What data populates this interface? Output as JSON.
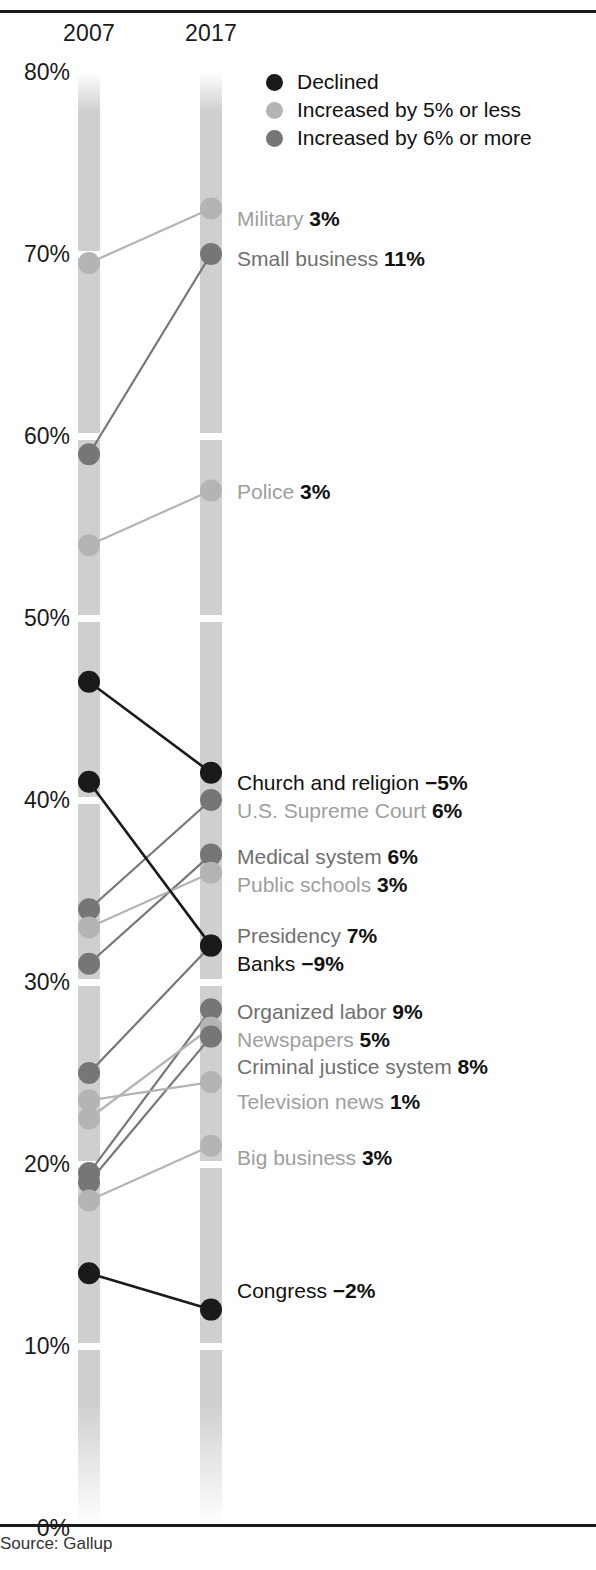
{
  "header": {
    "columns": [
      "2007",
      "2017"
    ]
  },
  "source": {
    "text": "Source: Gallup"
  },
  "legend": {
    "position": "top-right",
    "items": [
      {
        "label": "Declined",
        "color": "#1a1a1a"
      },
      {
        "label": "Increased by 5% or less",
        "color": "#b4b4b4"
      },
      {
        "label": "Increased by 6% or more",
        "color": "#767676"
      }
    ]
  },
  "axis": {
    "ticks": [
      "80%",
      "70%",
      "60%",
      "50%",
      "40%",
      "30%",
      "20%",
      "10%",
      "0%"
    ],
    "min": 0,
    "max": 80
  },
  "colors": {
    "declined": "#1a1a1a",
    "increase_small": "#b4b4b4",
    "increase_large": "#767676",
    "bar": "#cfcfcf",
    "rule": "#1a1a1a",
    "label_dark": "#111111",
    "label_mid": "#6f6f6f",
    "label_light": "#9e9e9e"
  },
  "chart_data": {
    "type": "line",
    "subtype": "slope-chart",
    "title": "",
    "xlabel": "",
    "ylabel": "",
    "categories": [
      "2007",
      "2017"
    ],
    "ylim": [
      0,
      80
    ],
    "ytick_labels": [
      "0%",
      "10%",
      "20%",
      "30%",
      "40%",
      "50%",
      "60%",
      "70%",
      "80%"
    ],
    "grid": false,
    "series": [
      {
        "name": "Military",
        "label": "Military",
        "value_label": "3%",
        "delta": 3,
        "v2007": 69.5,
        "v2017": 72.5,
        "group": "increase_small"
      },
      {
        "name": "Small business",
        "label": "Small business",
        "value_label": "11%",
        "delta": 11,
        "v2007": 59.0,
        "v2017": 70.0,
        "group": "increase_large"
      },
      {
        "name": "Police",
        "label": "Police",
        "value_label": "3%",
        "delta": 3,
        "v2007": 54.0,
        "v2017": 57.0,
        "group": "increase_small"
      },
      {
        "name": "Church and religion",
        "label": "Church and religion",
        "value_label": "−5%",
        "delta": -5,
        "v2007": 46.5,
        "v2017": 41.5,
        "group": "declined"
      },
      {
        "name": "U.S. Supreme Court",
        "label": "U.S. Supreme Court",
        "value_label": "6%",
        "delta": 6,
        "v2007": 34.0,
        "v2017": 40.0,
        "group": "increase_large"
      },
      {
        "name": "Medical system",
        "label": "Medical system",
        "value_label": "6%",
        "delta": 6,
        "v2007": 31.0,
        "v2017": 37.0,
        "group": "increase_large"
      },
      {
        "name": "Public schools",
        "label": "Public schools",
        "value_label": "3%",
        "delta": 3,
        "v2007": 33.0,
        "v2017": 36.0,
        "group": "increase_small"
      },
      {
        "name": "Presidency",
        "label": "Presidency",
        "value_label": "7%",
        "delta": 7,
        "v2007": 25.0,
        "v2017": 32.0,
        "group": "increase_large"
      },
      {
        "name": "Banks",
        "label": "Banks",
        "value_label": "−9%",
        "delta": -9,
        "v2007": 41.0,
        "v2017": 32.0,
        "group": "declined"
      },
      {
        "name": "Organized labor",
        "label": "Organized labor",
        "value_label": "9%",
        "delta": 9,
        "v2007": 19.5,
        "v2017": 28.5,
        "group": "increase_large"
      },
      {
        "name": "Newspapers",
        "label": "Newspapers",
        "value_label": "5%",
        "delta": 5,
        "v2007": 22.5,
        "v2017": 27.5,
        "group": "increase_small"
      },
      {
        "name": "Criminal justice system",
        "label": "Criminal justice system",
        "value_label": "8%",
        "delta": 8,
        "v2007": 19.0,
        "v2017": 27.0,
        "group": "increase_large"
      },
      {
        "name": "Television news",
        "label": "Television news",
        "value_label": "1%",
        "delta": 1,
        "v2007": 23.5,
        "v2017": 24.5,
        "group": "increase_small"
      },
      {
        "name": "Big business",
        "label": "Big business",
        "value_label": "3%",
        "delta": 3,
        "v2007": 18.0,
        "v2017": 21.0,
        "group": "increase_small"
      },
      {
        "name": "Congress",
        "label": "Congress",
        "value_label": "−2%",
        "delta": -2,
        "v2007": 14.0,
        "v2017": 12.0,
        "group": "declined"
      }
    ]
  },
  "annotations": [
    {
      "label": "Military",
      "value_label": "3%",
      "tone": "light",
      "y": 218
    },
    {
      "label": "Small business",
      "value_label": "11%",
      "tone": "mid",
      "y": 258
    },
    {
      "label": "Police",
      "value_label": "3%",
      "tone": "light",
      "y": 491
    },
    {
      "label": "Church and religion",
      "value_label": "−5%",
      "tone": "dark",
      "y": 782
    },
    {
      "label": "U.S. Supreme Court",
      "value_label": "6%",
      "tone": "light",
      "y": 810
    },
    {
      "label": "Medical system",
      "value_label": "6%",
      "tone": "mid",
      "y": 856
    },
    {
      "label": "Public schools",
      "value_label": "3%",
      "tone": "light",
      "y": 884
    },
    {
      "label": "Presidency",
      "value_label": "7%",
      "tone": "mid",
      "y": 935
    },
    {
      "label": "Banks",
      "value_label": "−9%",
      "tone": "dark",
      "y": 963
    },
    {
      "label": "Organized labor",
      "value_label": "9%",
      "tone": "mid",
      "y": 1011
    },
    {
      "label": "Newspapers",
      "value_label": "5%",
      "tone": "light",
      "y": 1039
    },
    {
      "label": "Criminal justice system",
      "value_label": "8%",
      "tone": "mid",
      "y": 1066
    },
    {
      "label": "Television news",
      "value_label": "1%",
      "tone": "light",
      "y": 1101
    },
    {
      "label": "Big business",
      "value_label": "3%",
      "tone": "light",
      "y": 1157
    },
    {
      "label": "Congress",
      "value_label": "−2%",
      "tone": "dark",
      "y": 1290
    }
  ]
}
